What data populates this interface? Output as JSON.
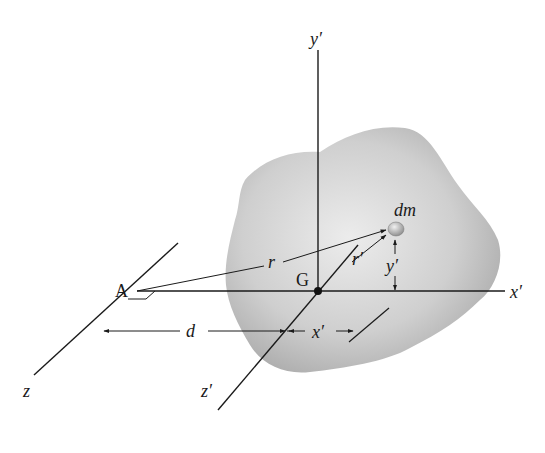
{
  "figure": {
    "colors": {
      "line": "#1a1a1a",
      "body_light": "#e4e4e4",
      "body_dark": "#a8a8a8",
      "background": "#ffffff"
    },
    "points": {
      "A": "A",
      "G": "G"
    },
    "axes": {
      "x_prime": "x′",
      "y_prime": "y′",
      "z": "z",
      "z_prime": "z′"
    },
    "vectors": {
      "r": "r",
      "r_prime": "r′"
    },
    "dimensions": {
      "d": "d",
      "x_prime_dim": "x′",
      "y_prime_dim": "y′"
    },
    "element": {
      "dm": "dm"
    }
  }
}
